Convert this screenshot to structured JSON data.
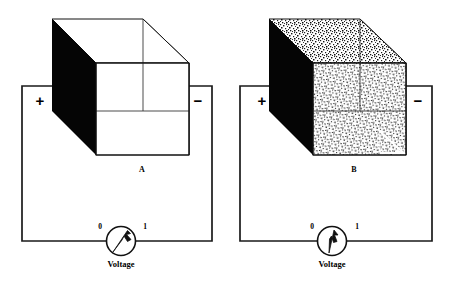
{
  "figure": {
    "background_color": "#ffffff",
    "ink_color": "#111111"
  },
  "panels": [
    {
      "id": "panel-a",
      "box_label": "A",
      "plus_sign": "+",
      "minus_sign": "−",
      "box_fill_description": "empty",
      "box_interior_texture": "none",
      "meter": {
        "label": "Voltage",
        "scale_min": "0",
        "scale_max": "1",
        "needle_reading": 0.78,
        "needle_angle_deg": 38
      }
    },
    {
      "id": "panel-b",
      "box_label": "B",
      "plus_sign": "+",
      "minus_sign": "−",
      "box_fill_description": "filled with speckled dielectric",
      "box_interior_texture": "speckle",
      "meter": {
        "label": "Voltage",
        "scale_min": "0",
        "scale_max": "1",
        "needle_reading": 0.5,
        "needle_angle_deg": 6
      }
    }
  ],
  "colors": {
    "plate_dark": "#050505",
    "plate_hatch": "#8a8a8a",
    "speckle": "#777777",
    "wire": "#1a1a1a",
    "face_white": "#ffffff"
  }
}
